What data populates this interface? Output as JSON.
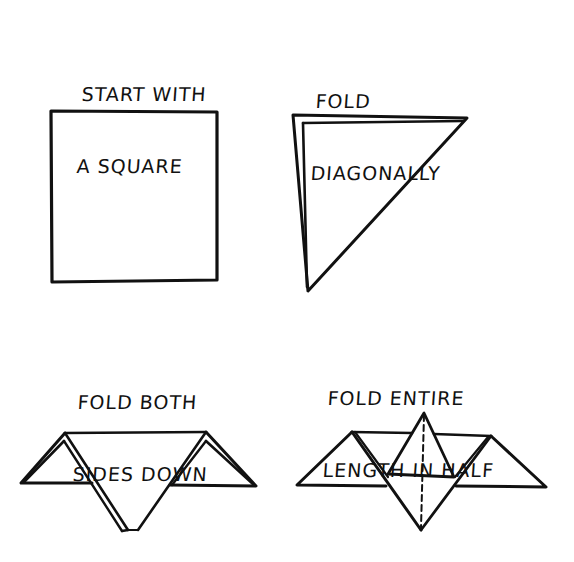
{
  "steps": [
    {
      "number": 1,
      "caption_lines": [
        "START WITH",
        "A SQUARE"
      ],
      "figure": "square"
    },
    {
      "number": 2,
      "caption_lines": [
        "FOLD",
        "DIAGONALLY"
      ],
      "figure": "triangle"
    },
    {
      "number": 3,
      "caption_lines": [
        "FOLD BOTH",
        "SIDES DOWN"
      ],
      "figure": "sides-folded-down"
    },
    {
      "number": 4,
      "caption_lines": [
        "FOLD ENTIRE",
        "LENGTH IN HALF"
      ],
      "figure": "folded-in-half-with-dashed-fold-line"
    }
  ],
  "colors": {
    "ink": "#111111",
    "paper": "#ffffff"
  }
}
